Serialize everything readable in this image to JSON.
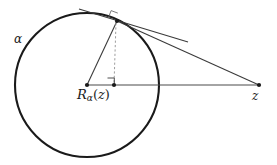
{
  "figure": {
    "type": "geometry-diagram",
    "background_color": "#ffffff",
    "stroke_color": "#1a1a1a",
    "thin_stroke_color": "#3a3a3a",
    "dashed_stroke_color": "#9a9a9a",
    "labels": {
      "circle_label": "α",
      "radius_map_base": "R",
      "radius_map_sub": "α",
      "radius_map_open": "(",
      "radius_map_arg": "z",
      "radius_map_close": ")",
      "radius_map_full": "Rα(z)",
      "point_z": "z"
    },
    "circle": {
      "name": "alpha",
      "center_x": 87,
      "center_y": 85,
      "radius": 72,
      "stroke_width": 2.1
    },
    "points": [
      {
        "name": "center",
        "label": "",
        "x": 87,
        "y": 85
      },
      {
        "name": "reflection-point",
        "label": "Rα(z)",
        "x": 114,
        "y": 85
      },
      {
        "name": "tangent-point",
        "label": "",
        "x": 117,
        "y": 21
      },
      {
        "name": "point-z",
        "label": "z",
        "x": 259,
        "y": 85
      }
    ],
    "segments": [
      {
        "name": "horizontal-axis",
        "x1": 87,
        "y1": 85,
        "x2": 259,
        "y2": 85,
        "style": "solid",
        "width": 1.1
      },
      {
        "name": "radius-to-tangent-point",
        "x1": 87,
        "y1": 85,
        "x2": 117,
        "y2": 21,
        "style": "solid",
        "width": 1.1
      },
      {
        "name": "tangent-point-to-z",
        "x1": 117,
        "y1": 21,
        "x2": 259,
        "y2": 85,
        "style": "solid",
        "width": 1.1
      },
      {
        "name": "tangent-line",
        "x1": 80,
        "y1": 10,
        "x2": 186,
        "y2": 41,
        "style": "solid",
        "width": 1.1
      },
      {
        "name": "perpendicular-drop",
        "x1": 116,
        "y1": 22,
        "x2": 114,
        "y2": 85,
        "style": "dashed",
        "width": 1.0
      }
    ],
    "right_angle_markers": [
      {
        "name": "right-angle-at-tangent-point",
        "x": 117,
        "y": 21,
        "size": 7
      },
      {
        "name": "right-angle-at-foot",
        "x": 114,
        "y": 85,
        "size": 7
      }
    ],
    "colors": {
      "ink": "#1a1a1a",
      "thin_ink": "#3a3a3a",
      "dashed": "#9a9a9a",
      "paper": "#ffffff"
    }
  }
}
